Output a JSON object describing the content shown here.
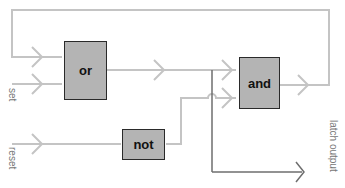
{
  "diagram": {
    "type": "logic-circuit",
    "gates": [
      {
        "id": "or",
        "label": "or"
      },
      {
        "id": "and",
        "label": "and"
      },
      {
        "id": "not",
        "label": "not"
      }
    ],
    "inputs": [
      {
        "id": "set",
        "label": "set"
      },
      {
        "id": "reset",
        "label": "reset"
      }
    ],
    "outputs": [
      {
        "id": "latch_output",
        "label": "latch output"
      }
    ],
    "connections": [
      {
        "from": "and",
        "to": "or",
        "note": "feedback loop"
      },
      {
        "from": "set",
        "to": "or"
      },
      {
        "from": "or",
        "to": "and"
      },
      {
        "from": "reset",
        "to": "not"
      },
      {
        "from": "not",
        "to": "and"
      },
      {
        "from": "or",
        "to": "latch_output"
      }
    ],
    "colors": {
      "wire_light": "#c4c4c4",
      "wire_dark": "#6e6e6e",
      "gate_fill": "#b4b4b4",
      "gate_border": "#2a2a2a",
      "label": "#777777"
    }
  }
}
